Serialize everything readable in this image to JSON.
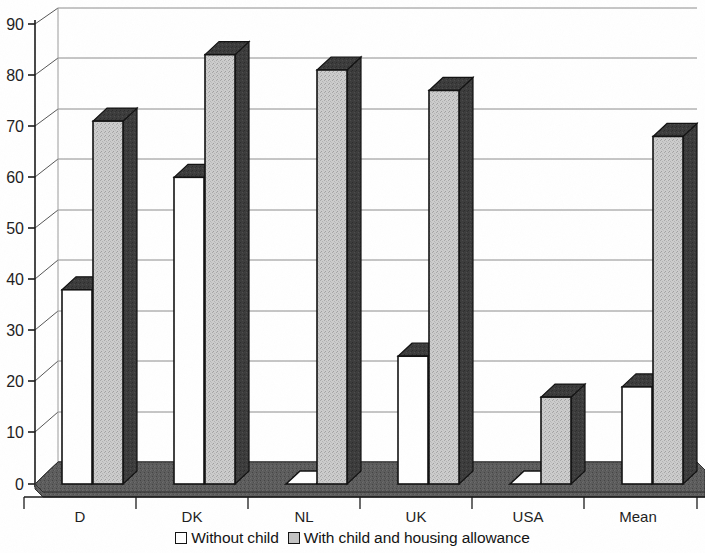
{
  "chart_data": {
    "type": "bar",
    "title": "",
    "subtitle": "",
    "xlabel": "",
    "ylabel": "",
    "ylim": [
      0,
      90
    ],
    "ytick_step": 10,
    "yticks": [
      0,
      10,
      20,
      30,
      40,
      50,
      60,
      70,
      80,
      90
    ],
    "grid": true,
    "three_d": true,
    "legend_position": "bottom-center",
    "categories": [
      "D",
      "DK",
      "NL",
      "UK",
      "USA",
      "Mean"
    ],
    "series": [
      {
        "name": "Without child",
        "color": "#ffffff",
        "values": [
          38,
          60,
          0,
          25,
          0,
          19
        ]
      },
      {
        "name": "With child and housing allowance",
        "color": "#c2c2c2",
        "values": [
          71,
          84,
          81,
          77,
          17,
          68
        ]
      }
    ]
  },
  "axis": {
    "ytick_labels": [
      "90",
      "80",
      "70",
      "60",
      "50",
      "40",
      "30",
      "20",
      "10",
      "0"
    ],
    "category_labels": [
      "D",
      "DK",
      "NL",
      "UK",
      "USA",
      "Mean"
    ]
  },
  "legend": {
    "items": [
      {
        "label": "Without child",
        "swatch": "white"
      },
      {
        "label": "With child and housing allowance",
        "swatch": "gray"
      }
    ]
  },
  "colors": {
    "bar_front_white": "#ffffff",
    "bar_front_gray": "#c9c9c9",
    "bar_side_dark": "#3a3a3a",
    "bar_top_dark": "#4a4a4a",
    "floor": "#5a5a5a",
    "outline": "#111111",
    "gridline": "#8c8c8c"
  }
}
